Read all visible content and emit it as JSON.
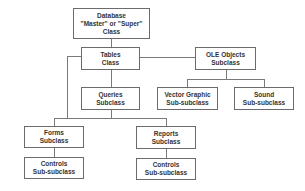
{
  "diagram": {
    "type": "class-hierarchy",
    "nodes": {
      "database": {
        "line1": "Database",
        "line2": "\"Master\" or \"Super\"",
        "line3": "Class"
      },
      "tables": {
        "line1": "Tables",
        "line2": "Class"
      },
      "ole_objects": {
        "line1": "OLE Objects",
        "line2": "Subclass"
      },
      "queries": {
        "line1": "Queries",
        "line2": "Subclass"
      },
      "vector_graphic": {
        "line1": "Vector Graphic",
        "line2": "Sub-subclass"
      },
      "sound": {
        "line1": "Sound",
        "line2": "Sub-subclass"
      },
      "forms": {
        "line1": "Forms",
        "line2": "Subclass"
      },
      "reports": {
        "line1": "Reports",
        "line2": "Subclass"
      },
      "forms_controls": {
        "line1": "Controls",
        "line2": "Sub-subclass"
      },
      "reports_controls": {
        "line1": "Controls",
        "line2": "Sub-subclass"
      }
    },
    "edges": [
      [
        "database",
        "tables"
      ],
      [
        "tables",
        "ole_objects"
      ],
      [
        "tables",
        "queries"
      ],
      [
        "tables",
        "forms"
      ],
      [
        "queries",
        "forms"
      ],
      [
        "queries",
        "reports"
      ],
      [
        "ole_objects",
        "vector_graphic"
      ],
      [
        "ole_objects",
        "sound"
      ],
      [
        "forms",
        "forms_controls"
      ],
      [
        "reports",
        "reports_controls"
      ]
    ],
    "colors": {
      "border": "#6b6b6b",
      "line": "#7a7a7a",
      "text": "#333333",
      "background": "#ffffff"
    }
  }
}
